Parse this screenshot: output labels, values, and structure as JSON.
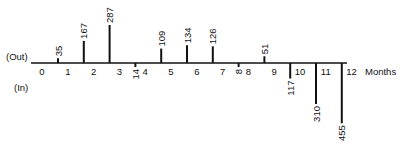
{
  "chart_data": {
    "type": "bar",
    "title": "",
    "xlabel": "Months",
    "ylabel": "",
    "side_labels": {
      "out": "(Out)",
      "in": "(In)"
    },
    "x_ticks": [
      "0",
      "1",
      "2",
      "3",
      "4",
      "5",
      "6",
      "7",
      "8",
      "9",
      "10",
      "11",
      "12"
    ],
    "categories": [
      "0.5",
      "1.5",
      "2.5",
      "3.5",
      "4.5",
      "5.5",
      "6.5",
      "7.5",
      "8.5",
      "9.5",
      "10.5",
      "11.5"
    ],
    "series": [
      {
        "name": "Cash flow",
        "values": [
          35,
          167,
          287,
          -14,
          109,
          134,
          126,
          -8,
          51,
          -117,
          -310,
          -455
        ]
      }
    ],
    "value_labels": [
      "35",
      "167",
      "287",
      "14",
      "109",
      "134",
      "126",
      "8",
      "51",
      "117",
      "310",
      "455"
    ],
    "grid": false,
    "legend": "none"
  }
}
